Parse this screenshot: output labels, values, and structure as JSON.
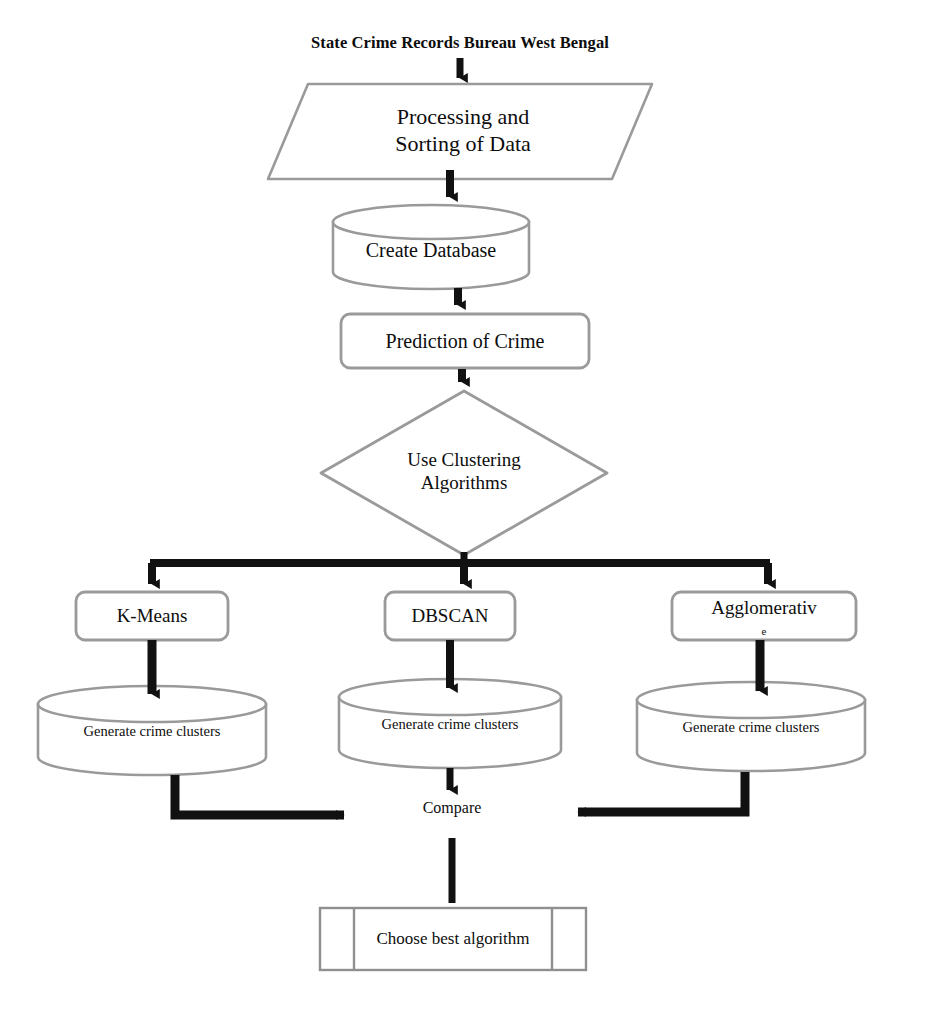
{
  "diagram": {
    "title": "State Crime Records Bureau West Bengal",
    "colors": {
      "shape_stroke": "#9a9a9a",
      "arrow": "#111111",
      "text": "#0d0d0d",
      "background": "#ffffff"
    },
    "nodes": {
      "source": {
        "label": "State Crime Records Bureau West Bengal",
        "shape": "text"
      },
      "processing": {
        "label": "Processing and\nSorting of Data",
        "shape": "parallelogram"
      },
      "create_database": {
        "label": "Create Database",
        "shape": "cylinder"
      },
      "prediction": {
        "label": "Prediction of Crime",
        "shape": "rounded-rect"
      },
      "clustering": {
        "label": "Use Clustering\nAlgorithms",
        "shape": "diamond"
      },
      "kmeans": {
        "label": "K-Means",
        "shape": "rounded-rect"
      },
      "dbscan": {
        "label": "DBSCAN",
        "shape": "rounded-rect"
      },
      "agglomerative": {
        "label": "Agglomerativ",
        "label_overflow": "e",
        "shape": "rounded-rect"
      },
      "clusters_kmeans": {
        "label": "Generate crime  clusters",
        "shape": "cylinder"
      },
      "clusters_dbscan": {
        "label": "Generate crime clusters",
        "shape": "cylinder"
      },
      "clusters_agglomerative": {
        "label": "Generate crime clusters",
        "shape": "cylinder"
      },
      "compare": {
        "label": "Compare",
        "shape": "text"
      },
      "choose_best": {
        "label": "Choose best algorithm",
        "shape": "predefined-process"
      }
    },
    "edges": [
      {
        "from": "source",
        "to": "processing"
      },
      {
        "from": "processing",
        "to": "create_database"
      },
      {
        "from": "create_database",
        "to": "prediction"
      },
      {
        "from": "prediction",
        "to": "clustering"
      },
      {
        "from": "clustering",
        "to": "kmeans"
      },
      {
        "from": "clustering",
        "to": "dbscan"
      },
      {
        "from": "clustering",
        "to": "agglomerative"
      },
      {
        "from": "kmeans",
        "to": "clusters_kmeans"
      },
      {
        "from": "dbscan",
        "to": "clusters_dbscan"
      },
      {
        "from": "agglomerative",
        "to": "clusters_agglomerative"
      },
      {
        "from": "clusters_kmeans",
        "to": "compare"
      },
      {
        "from": "clusters_dbscan",
        "to": "compare"
      },
      {
        "from": "clusters_agglomerative",
        "to": "compare"
      },
      {
        "from": "compare",
        "to": "choose_best"
      }
    ]
  }
}
